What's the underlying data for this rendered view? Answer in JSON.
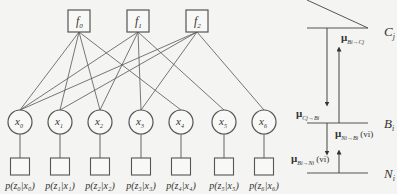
{
  "diagram": {
    "title": "",
    "factors": [
      {
        "id": "f0",
        "label": "f",
        "sub": "0",
        "x": 79,
        "y": 21
      },
      {
        "id": "f1",
        "label": "f",
        "sub": "1",
        "x": 138,
        "y": 21
      },
      {
        "id": "f2",
        "label": "f",
        "sub": "2",
        "x": 197,
        "y": 21
      }
    ],
    "variables": [
      {
        "id": "x0",
        "label": "x",
        "sub": "0",
        "x": 20,
        "y": 122
      },
      {
        "id": "x1",
        "label": "x",
        "sub": "1",
        "x": 60,
        "y": 122
      },
      {
        "id": "x2",
        "label": "x",
        "sub": "2",
        "x": 100,
        "y": 122
      },
      {
        "id": "x3",
        "label": "x",
        "sub": "3",
        "x": 141,
        "y": 122
      },
      {
        "id": "x4",
        "label": "x",
        "sub": "4",
        "x": 181,
        "y": 122
      },
      {
        "id": "x5",
        "label": "x",
        "sub": "5",
        "x": 224,
        "y": 122
      },
      {
        "id": "x6",
        "label": "x",
        "sub": "6",
        "x": 264,
        "y": 122
      }
    ],
    "likelihoods": [
      {
        "label": "p(z₀|x₀)"
      },
      {
        "label": "p(z₁|x₁)"
      },
      {
        "label": "p(z₂|x₂)"
      },
      {
        "label": "p(z₃|x₃)"
      },
      {
        "label": "p(z₄|x₄)"
      },
      {
        "label": "p(z₅|x₅)"
      },
      {
        "label": "p(z₆|x₆)"
      }
    ],
    "edges": [
      [
        "f0",
        "x0"
      ],
      [
        "f0",
        "x1"
      ],
      [
        "f0",
        "x2"
      ],
      [
        "f0",
        "x4"
      ],
      [
        "f1",
        "x0"
      ],
      [
        "f1",
        "x2"
      ],
      [
        "f1",
        "x3"
      ],
      [
        "f1",
        "x5"
      ],
      [
        "f2",
        "x0"
      ],
      [
        "f2",
        "x1"
      ],
      [
        "f2",
        "x3"
      ],
      [
        "f2",
        "x6"
      ]
    ]
  },
  "message_panel": {
    "levels": [
      {
        "label": "C",
        "sub": "j"
      },
      {
        "label": "B",
        "sub": "i"
      },
      {
        "label": "N",
        "sub": "i"
      }
    ],
    "messages": [
      {
        "mu": "μ",
        "sub": "Bi→Cj",
        "arg": ""
      },
      {
        "mu": "μ",
        "sub": "Cj→Bi",
        "arg": ""
      },
      {
        "mu": "μ",
        "sub": "Ni→Bi",
        "arg": "(vi)"
      },
      {
        "mu": "μ",
        "sub": "Bi→Ni",
        "arg": "(vi)"
      }
    ]
  }
}
